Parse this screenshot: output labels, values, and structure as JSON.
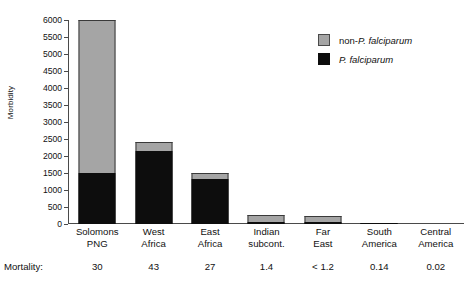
{
  "chart_data": {
    "type": "bar",
    "title": "",
    "xlabel": "",
    "ylabel": "Morbidity",
    "ylim": [
      0,
      6000
    ],
    "ytick_step": 500,
    "yticks": [
      0,
      500,
      1000,
      1500,
      2000,
      2500,
      3000,
      3500,
      4000,
      4500,
      5000,
      5500,
      6000
    ],
    "ytick_labels": [
      "0",
      "500",
      "1000",
      "1500",
      "2000",
      "2500",
      "3000",
      "3500",
      "4000",
      "4500",
      "5000",
      "5500",
      "6000"
    ],
    "grid": false,
    "stacked": true,
    "legend_position": "top-right",
    "categories": [
      "Solomons PNG",
      "West Africa",
      "East Africa",
      "Indian subcont.",
      "Far East",
      "South America",
      "Central America"
    ],
    "category_lines": [
      [
        "Solomons",
        "PNG"
      ],
      [
        "West",
        "Africa"
      ],
      [
        "East",
        "Africa"
      ],
      [
        "Indian",
        "subcont."
      ],
      [
        "Far",
        "East"
      ],
      [
        "South",
        "America"
      ],
      [
        "Central",
        "America"
      ]
    ],
    "series": [
      {
        "name": "P. falciparum",
        "color": "#0d0d0d",
        "values": [
          1500,
          2150,
          1320,
          60,
          50,
          20,
          0
        ]
      },
      {
        "name": "non-P. falciparum",
        "color": "#a5a5a5",
        "values": [
          4500,
          250,
          180,
          200,
          200,
          10,
          0
        ]
      }
    ],
    "totals": [
      6000,
      2400,
      1500,
      260,
      250,
      30,
      0
    ],
    "annotations": {
      "mortality_label": "Mortality:",
      "mortality_values": [
        "30",
        "43",
        "27",
        "1.4",
        "< 1.2",
        "0.14",
        "0.02"
      ]
    }
  },
  "legend": {
    "items": [
      {
        "prefix": "non-",
        "italic": "P. falciparum",
        "swatch": "gray-swatch",
        "color": "#a5a5a5"
      },
      {
        "prefix": "",
        "italic": "P. falciparum",
        "swatch": "black-swatch",
        "color": "#0d0d0d"
      }
    ]
  },
  "axis": {
    "y_title": "Morbidity"
  }
}
